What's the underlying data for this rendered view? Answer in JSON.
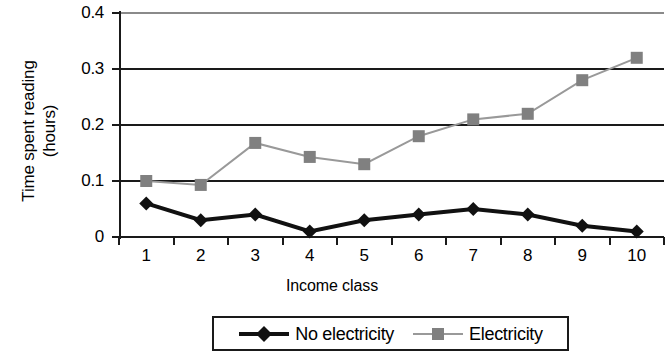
{
  "chart_data": {
    "type": "line",
    "title": "",
    "xlabel": "Income class",
    "ylabel": "Time spent reading (hours)",
    "ylabel_line1": "Time spent reading",
    "ylabel_line2": "(hours)",
    "categories": [
      "1",
      "2",
      "3",
      "4",
      "5",
      "6",
      "7",
      "8",
      "9",
      "10"
    ],
    "x": [
      1,
      2,
      3,
      4,
      5,
      6,
      7,
      8,
      9,
      10
    ],
    "ylim": [
      0,
      0.4
    ],
    "xlim": [
      0.5,
      10.5
    ],
    "ytick_labels": [
      "0",
      "0.1",
      "0.2",
      "0.3",
      "0.4"
    ],
    "ytick_values": [
      0,
      0.1,
      0.2,
      0.3,
      0.4
    ],
    "grid": "horizontal",
    "legend_position": "bottom-center",
    "series": [
      {
        "name": "No electricity",
        "color": "#111111",
        "marker": "diamond",
        "values": [
          0.06,
          0.03,
          0.04,
          0.01,
          0.03,
          0.04,
          0.05,
          0.04,
          0.02,
          0.01
        ]
      },
      {
        "name": "Electricity",
        "color": "#808080",
        "marker": "square",
        "values": [
          0.1,
          0.093,
          0.168,
          0.143,
          0.13,
          0.18,
          0.21,
          0.22,
          0.28,
          0.32
        ]
      }
    ]
  },
  "legend": {
    "items": [
      {
        "label": "No electricity",
        "marker": "diamond-marker",
        "color": "#111111"
      },
      {
        "label": "Electricity",
        "marker": "square-marker",
        "color": "#808080"
      }
    ]
  }
}
